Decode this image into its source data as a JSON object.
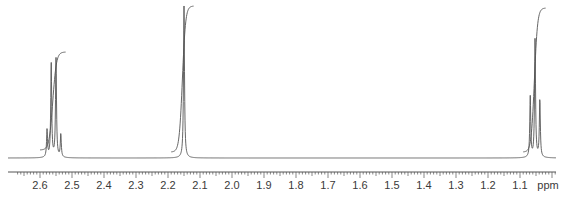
{
  "chart_data": {
    "type": "line",
    "title": "",
    "subtitle": "1H NMR spectrum",
    "xlabel": "ppm",
    "ylabel": "",
    "x_reversed": true,
    "xlim": [
      2.65,
      1.0
    ],
    "grid": false,
    "legend": null,
    "tick_labels": [
      "2.6",
      "2.5",
      "2.4",
      "2.3",
      "2.2",
      "2.1",
      "2.0",
      "1.9",
      "1.8",
      "1.7",
      "1.6",
      "1.5",
      "1.4",
      "1.3",
      "1.2",
      "1.1"
    ],
    "minor_tick_step": 0.01,
    "peaks": [
      {
        "label": "quartet",
        "center_ppm": 2.555,
        "lines_ppm": [
          2.578,
          2.565,
          2.55,
          2.535
        ],
        "relative_heights": [
          0.18,
          0.62,
          0.65,
          0.15
        ],
        "integral_rel": 2
      },
      {
        "label": "singlet",
        "center_ppm": 2.15,
        "lines_ppm": [
          2.15
        ],
        "relative_heights": [
          1.0
        ],
        "integral_rel": 3
      },
      {
        "label": "triplet",
        "center_ppm": 1.05,
        "lines_ppm": [
          1.068,
          1.053,
          1.038
        ],
        "relative_heights": [
          0.4,
          0.78,
          0.38
        ],
        "integral_rel": 3
      }
    ],
    "integral_curves": [
      {
        "start_ppm": 2.6,
        "end_ppm": 2.52,
        "y_bottom_px": 150,
        "y_top_px": 52
      },
      {
        "start_ppm": 2.19,
        "end_ppm": 2.12,
        "y_bottom_px": 152,
        "y_top_px": 6
      },
      {
        "start_ppm": 1.09,
        "end_ppm": 1.02,
        "y_bottom_px": 152,
        "y_top_px": 8
      }
    ],
    "colors": {
      "trace": "#555555",
      "axis": "#555555",
      "text": "#3a3a3a"
    }
  },
  "axis": {
    "unit_label": "ppm",
    "ticks": [
      "2.6",
      "2.5",
      "2.4",
      "2.3",
      "2.2",
      "2.1",
      "2.0",
      "1.9",
      "1.8",
      "1.7",
      "1.6",
      "1.5",
      "1.4",
      "1.3",
      "1.2",
      "1.1"
    ]
  }
}
